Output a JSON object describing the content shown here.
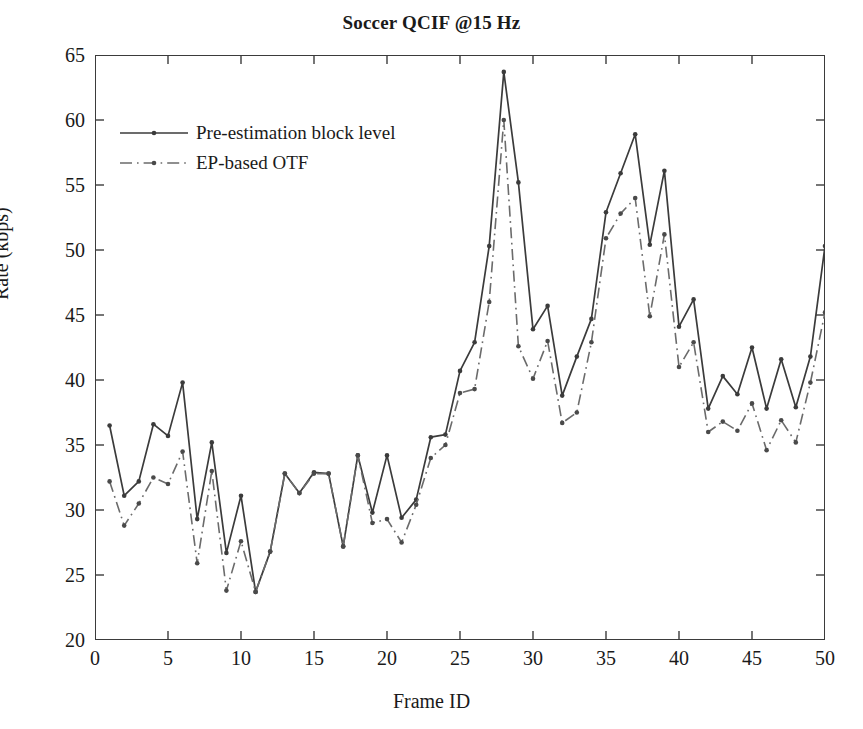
{
  "chart_data": {
    "type": "line",
    "title": "Soccer QCIF @15 Hz",
    "xlabel": "Frame ID",
    "ylabel": "Rate (kbps)",
    "xlim": [
      0,
      50
    ],
    "ylim": [
      20,
      65
    ],
    "xticks": [
      0,
      5,
      10,
      15,
      20,
      25,
      30,
      35,
      40,
      45,
      50
    ],
    "yticks": [
      20,
      25,
      30,
      35,
      40,
      45,
      50,
      55,
      60,
      65
    ],
    "grid": false,
    "legend_position": "upper left",
    "x": [
      1,
      2,
      3,
      4,
      5,
      6,
      7,
      8,
      9,
      10,
      11,
      12,
      13,
      14,
      15,
      16,
      17,
      18,
      19,
      20,
      21,
      22,
      23,
      24,
      25,
      26,
      27,
      28,
      29,
      30,
      31,
      32,
      33,
      34,
      35,
      36,
      37,
      38,
      39,
      40,
      41,
      42,
      43,
      44,
      45,
      46,
      47,
      48,
      49,
      50
    ],
    "series": [
      {
        "name": "Pre-estimation block level",
        "style": "solid",
        "color": "#3b3b3b",
        "marker": "dot",
        "values": [
          36.5,
          31.1,
          32.2,
          36.6,
          35.7,
          39.8,
          29.3,
          35.2,
          26.7,
          31.1,
          23.7,
          26.8,
          32.8,
          31.3,
          32.9,
          32.8,
          27.2,
          34.2,
          29.8,
          34.2,
          29.4,
          30.8,
          35.6,
          35.8,
          40.7,
          42.9,
          50.3,
          63.7,
          55.2,
          43.9,
          45.7,
          38.8,
          41.8,
          44.7,
          52.9,
          55.9,
          58.9,
          50.4,
          56.1,
          44.1,
          46.2,
          37.8,
          40.3,
          38.9,
          42.5,
          37.8,
          41.6,
          37.9,
          41.8,
          50.3
        ]
      },
      {
        "name": "EP-based OTF",
        "style": "dashdot",
        "color": "#6b6b6b",
        "marker": "dot",
        "values": [
          32.2,
          28.8,
          30.5,
          32.5,
          32.0,
          34.5,
          25.9,
          33.0,
          23.8,
          27.6,
          23.7,
          26.8,
          32.8,
          31.3,
          32.8,
          32.8,
          27.2,
          34.2,
          29.0,
          29.3,
          27.5,
          30.4,
          34.0,
          35.0,
          39.0,
          39.3,
          46.0,
          60.0,
          42.6,
          40.1,
          43.0,
          36.7,
          37.5,
          42.9,
          50.9,
          52.8,
          54.0,
          44.9,
          51.2,
          41.0,
          42.9,
          36.0,
          36.8,
          36.1,
          38.2,
          34.6,
          36.9,
          35.2,
          39.8,
          45.2
        ]
      }
    ]
  }
}
